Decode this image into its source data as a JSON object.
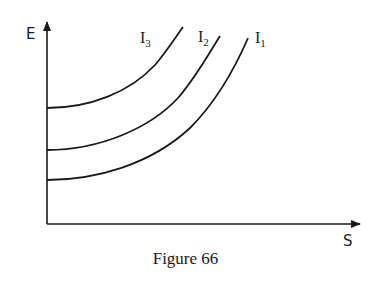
{
  "chart_data": {
    "type": "line",
    "title": "",
    "caption": "Figure 66",
    "xlabel": "S",
    "ylabel": "E",
    "grid": false,
    "ticks": false,
    "series": [
      {
        "name": "I1",
        "label_main": "I",
        "label_sub": "1",
        "shape": "convex increasing",
        "y_intercept_px": 180,
        "path": "M47,180 C95,180 150,165 190,128 C215,103 235,68 248,38",
        "label_x": 255,
        "label_y": 43
      },
      {
        "name": "I2",
        "label_main": "I",
        "label_sub": "2",
        "shape": "convex increasing",
        "y_intercept_px": 150,
        "path": "M47,150 C100,150 150,128 178,98 C196,77 208,55 220,36",
        "label_x": 198,
        "label_y": 42
      },
      {
        "name": "I3",
        "label_main": "I",
        "label_sub": "3",
        "shape": "convex increasing",
        "y_intercept_px": 108,
        "path": "M47,108 C90,108 130,92 155,65 C166,52 175,38 183,27",
        "label_x": 140,
        "label_y": 43
      }
    ]
  },
  "axes": {
    "x_label": "S",
    "y_label": "E"
  },
  "caption": "Figure 66"
}
